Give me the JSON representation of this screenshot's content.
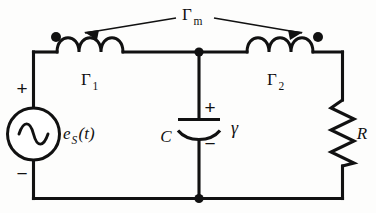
{
  "figure": {
    "kind": "electrical-circuit-schematic",
    "background_color": "#fdfdfc",
    "ink_color": "#111111"
  },
  "labels": {
    "mutual_coupling": {
      "symbol": "Γ",
      "subscript": "m",
      "full": "Γm",
      "role": "mutual inductance / coupling coefficient between the two coils"
    },
    "inductor_left": {
      "symbol": "Γ",
      "subscript": "1",
      "full": "Γ1",
      "role": "left inductor"
    },
    "inductor_right": {
      "symbol": "Γ",
      "subscript": "2",
      "full": "Γ2",
      "role": "right inductor"
    },
    "source": {
      "symbol": "e",
      "subscript": "S",
      "argument": "(t)",
      "full": "eS(t)",
      "role": "AC voltage source"
    },
    "capacitor": {
      "symbol": "C",
      "role": "shunt capacitor"
    },
    "capacitor_voltage": {
      "symbol": "γ",
      "role": "capacitor voltage variable"
    },
    "resistor": {
      "symbol": "R",
      "role": "load resistance"
    }
  },
  "polarity": {
    "source_plus": "+",
    "source_minus": "−",
    "capacitor_plus": "+",
    "capacitor_minus": "−"
  },
  "components": [
    {
      "id": "source",
      "type": "ac-voltage-source",
      "label": "eS(t)",
      "orientation": "vertical",
      "branch": "left-rail"
    },
    {
      "id": "l1",
      "type": "inductor",
      "label": "Γ1",
      "orientation": "horizontal",
      "branch": "top-left",
      "loops": 3,
      "dot_marker": "left"
    },
    {
      "id": "l2",
      "type": "inductor",
      "label": "Γ2",
      "orientation": "horizontal",
      "branch": "top-right",
      "loops": 3,
      "dot_marker": "right"
    },
    {
      "id": "c",
      "type": "capacitor",
      "label": "C",
      "orientation": "vertical",
      "branch": "shunt-middle"
    },
    {
      "id": "r",
      "type": "resistor",
      "label": "R",
      "orientation": "vertical",
      "branch": "right-rail",
      "zigzag_peaks": 6
    }
  ],
  "nodes": [
    {
      "id": "top-middle",
      "type": "junction-dot"
    },
    {
      "id": "bottom-middle",
      "type": "junction-dot"
    },
    {
      "id": "dot-l1-left",
      "type": "coupling-polarity-dot"
    },
    {
      "id": "dot-l2-right",
      "type": "coupling-polarity-dot"
    }
  ],
  "annotations": {
    "leader_arrows": [
      {
        "from": "mutual-coupling-label",
        "to": "dot-l1-left",
        "direction": "left"
      },
      {
        "from": "mutual-coupling-label",
        "to": "dot-l2-right",
        "direction": "right"
      }
    ]
  }
}
